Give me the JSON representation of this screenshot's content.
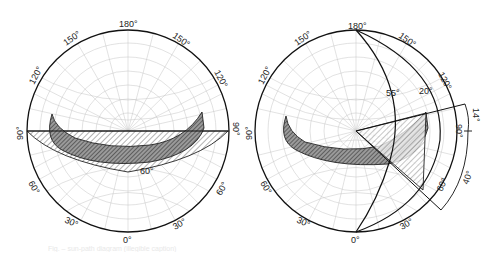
{
  "figure": {
    "left_diagram": {
      "labels": {
        "top": "180°",
        "upper_left": "150°",
        "upper_right": "150°",
        "mid_upper_left": "120°",
        "mid_upper_right": "120°",
        "left": "90°",
        "right": "90°",
        "lower_left": "60°",
        "lower_right": "60°",
        "bottom_left": "30°",
        "bottom_right": "30°",
        "bottom": "0°",
        "interior": "60°"
      }
    },
    "right_diagram": {
      "labels": {
        "top": "180°",
        "upper_left": "150°",
        "upper_right": "150°",
        "mid_upper_left": "120°",
        "mid_upper_right": "120°",
        "left": "90°",
        "right": "90°",
        "lower_left": "60°",
        "lower_right": "60°",
        "bottom_left": "30°",
        "bottom_right": "30°",
        "bottom": "0°",
        "interior_a": "55°",
        "interior_b": "20°",
        "dim_upper": "14°",
        "dim_lower": "40°"
      }
    },
    "caption": "Fig. – sun-path diagram (illegible caption)"
  },
  "colors": {
    "outline": "#1a1a1a",
    "grid": "#bdbdbd",
    "fill_dark": "#7a7a7a",
    "fill_light": "#d9d9d9",
    "background": "#ffffff"
  }
}
